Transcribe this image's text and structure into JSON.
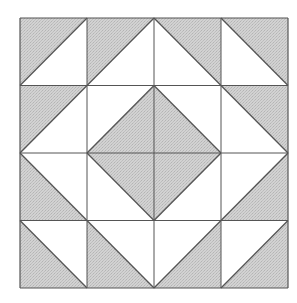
{
  "diagram": {
    "type": "quilt-block",
    "grid": {
      "rows": 4,
      "cols": 4
    },
    "origin": {
      "x": 20,
      "y": 18
    },
    "size": {
      "width": 268,
      "height": 270
    },
    "colors": {
      "fill_gray": "#cbcbcb",
      "fill_white": "#ffffff",
      "line": "#555555"
    },
    "cells": [
      [
        {
          "diag": "/",
          "gray": "tl"
        },
        {
          "diag": "/",
          "gray": "tl"
        },
        {
          "diag": "\\",
          "gray": "tr"
        },
        {
          "diag": "\\",
          "gray": "tr"
        }
      ],
      [
        {
          "diag": "/",
          "gray": "tl"
        },
        {
          "diag": "/",
          "gray": "br"
        },
        {
          "diag": "\\",
          "gray": "bl"
        },
        {
          "diag": "\\",
          "gray": "tr"
        }
      ],
      [
        {
          "diag": "\\",
          "gray": "bl"
        },
        {
          "diag": "\\",
          "gray": "tr"
        },
        {
          "diag": "/",
          "gray": "tl"
        },
        {
          "diag": "/",
          "gray": "br"
        }
      ],
      [
        {
          "diag": "\\",
          "gray": "bl"
        },
        {
          "diag": "\\",
          "gray": "bl"
        },
        {
          "diag": "/",
          "gray": "br"
        },
        {
          "diag": "/",
          "gray": "br"
        }
      ]
    ]
  }
}
